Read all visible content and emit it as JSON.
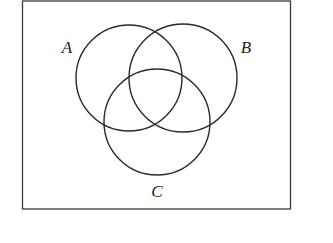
{
  "diagram": {
    "type": "venn",
    "universe": {
      "x": 22,
      "y": 1,
      "width": 268,
      "height": 208
    },
    "sets": [
      {
        "label": "A",
        "cx": 129,
        "cy": 78,
        "r": 53,
        "label_x": 67,
        "label_y": 53
      },
      {
        "label": "B",
        "cx": 183,
        "cy": 78,
        "r": 54,
        "label_x": 246,
        "label_y": 53
      },
      {
        "label": "C",
        "cx": 157,
        "cy": 122,
        "r": 53,
        "label_x": 157,
        "label_y": 197
      }
    ],
    "stroke_color": "#2a2a2a"
  }
}
